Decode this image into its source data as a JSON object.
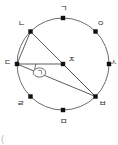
{
  "figure": {
    "shape": "circle",
    "stroke_color": "#6e6e6e",
    "chord_color": "#4a4a4a",
    "point_color": "#111111",
    "label_color": "#1a1a1a",
    "background": "#ffffff",
    "center": {
      "label": "ㅈ",
      "cx": 63,
      "cy": 64
    },
    "radius": 46,
    "points": [
      {
        "name": "point-top",
        "label": "ㄱ",
        "x": 63,
        "y": 18,
        "lx": 60,
        "ly": 9
      },
      {
        "name": "point-upper-left",
        "label": "ㄴ",
        "x": 30.5,
        "y": 31.5,
        "lx": 18,
        "ly": 24
      },
      {
        "name": "point-left",
        "label": "ㄷ",
        "x": 17,
        "y": 64,
        "lx": 5,
        "ly": 63
      },
      {
        "name": "point-lower-left",
        "label": "ㄹ",
        "x": 30.5,
        "y": 96.5,
        "lx": 17,
        "ly": 104
      },
      {
        "name": "point-bottom",
        "label": "ㅁ",
        "x": 63,
        "y": 110,
        "lx": 60,
        "ly": 121
      },
      {
        "name": "point-lower-right",
        "label": "ㅂ",
        "x": 95.5,
        "y": 96.5,
        "lx": 98,
        "ly": 104
      },
      {
        "name": "point-right",
        "label": "ㅅ",
        "x": 109,
        "y": 64,
        "lx": 110,
        "ly": 63
      },
      {
        "name": "point-upper-right",
        "label": "ㅇ",
        "x": 95.5,
        "y": 31.5,
        "lx": 97,
        "ly": 24
      }
    ],
    "center_point": {
      "name": "point-center",
      "label": "ㅈ",
      "x": 63,
      "y": 64,
      "lx": 68,
      "ly": 60
    },
    "segments": [
      {
        "name": "segment-nieun-to-bieup",
        "from": "ㄴ",
        "to": "ㅂ",
        "x1": 30.5,
        "y1": 31.5,
        "x2": 95.5,
        "y2": 96.5
      },
      {
        "name": "segment-digeut-to-jieut",
        "from": "ㄷ",
        "to": "ㅈ",
        "x1": 17,
        "y1": 64,
        "x2": 63,
        "y2": 64
      },
      {
        "name": "segment-digeut-to-bieup",
        "from": "ㄷ",
        "to": "ㅂ",
        "x1": 17,
        "y1": 64,
        "x2": 95.5,
        "y2": 96.5
      },
      {
        "name": "segment-digeut-to-nieun",
        "from": "ㄷ",
        "to": "ㄴ",
        "x1": 17,
        "y1": 64,
        "x2": 30.5,
        "y2": 31.5
      },
      {
        "name": "segment-jieut-to-bieup",
        "from": "ㅈ",
        "to": "ㅂ",
        "x1": 63,
        "y1": 64,
        "x2": 95.5,
        "y2": 96.5
      }
    ],
    "angle_marker": {
      "name": "angle-marker-circled-giyeok",
      "label": "ㄱ",
      "vertex": "ㄷ",
      "arc_radius": 19,
      "badge_cx": 39.5,
      "badge_cy": 72.5,
      "badge_rx": 6.2,
      "badge_ry": 4.6
    },
    "corner_artifact": {
      "name": "corner-artifact",
      "label": "(",
      "x": 1,
      "y": 137
    }
  }
}
